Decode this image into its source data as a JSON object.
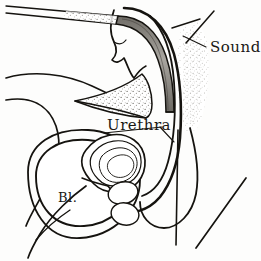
{
  "figure": {
    "kind": "medical-line-illustration",
    "background_color": "#fdfdfc",
    "ink_color": "#15130f",
    "stipple_color": "#5a5750",
    "instrument_shade_color": "#8d8a84",
    "width": 261,
    "height": 261
  },
  "labels": {
    "sound": "Sound",
    "urethra": "Urethra",
    "bladder": "Bl."
  },
  "label_positions": {
    "sound": {
      "x": 210,
      "y": 52,
      "font_size": 15
    },
    "urethra": {
      "x": 107,
      "y": 130,
      "font_size": 15
    },
    "bladder": {
      "x": 58,
      "y": 202,
      "font_size": 13
    }
  },
  "leader_lines": {
    "sound": {
      "x1": 206,
      "y1": 47,
      "x2": 183,
      "y2": 36
    },
    "urethra": {
      "x1": 160,
      "y1": 127,
      "x2": 172,
      "y2": 139
    }
  },
  "structures": [
    {
      "name": "sound-instrument-shaft",
      "description": "thin straight shaft entering from upper left"
    },
    {
      "name": "sound-instrument-curve",
      "description": "shaded curved portion descending through urethra"
    },
    {
      "name": "penis-glans-outline",
      "description": "glans and corpus contour at top center"
    },
    {
      "name": "pubic-symphysis-stipple",
      "description": "stippled triangular bone wedge"
    },
    {
      "name": "abdominal-wall-stipple",
      "description": "stippled vertical band on right"
    },
    {
      "name": "bladder-outline",
      "description": "large double-contour oval at lower left"
    },
    {
      "name": "prostate-outline",
      "description": "concentric oval rings right of bladder"
    },
    {
      "name": "bulbourethral-glands",
      "description": "two small ovals at urethral bend"
    },
    {
      "name": "scrotum-outline",
      "description": "pendulous contour on lower right"
    },
    {
      "name": "perineal-diagonal-line",
      "description": "diagonal stroke at lower right"
    },
    {
      "name": "abdominal-contour-lines",
      "description": "two sweeping curves from left edge"
    }
  ]
}
